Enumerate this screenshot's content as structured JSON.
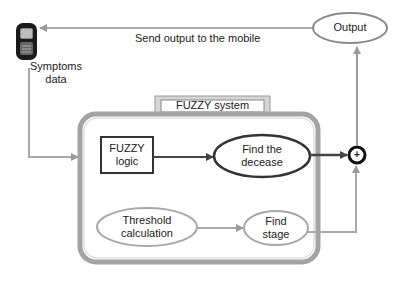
{
  "diagram": {
    "type": "flowchart",
    "nodes": {
      "mobile": {
        "label": "Symptoms data",
        "line1": "Symptoms",
        "line2": "data",
        "icon": "mobile-phone-icon"
      },
      "system_title": {
        "label": "FUZZY system"
      },
      "fuzzy_logic": {
        "line1": "FUZZY",
        "line2": "logic",
        "shape": "rectangle"
      },
      "find_decease": {
        "line1": "Find the",
        "line2": "decease",
        "shape": "ellipse"
      },
      "threshold": {
        "line1": "Threshold",
        "line2": "calculation",
        "shape": "ellipse"
      },
      "find_stage": {
        "line1": "Find",
        "line2": "stage",
        "shape": "ellipse"
      },
      "sum": {
        "symbol": "+",
        "shape": "circle"
      },
      "output": {
        "label": "Output",
        "shape": "ellipse"
      }
    },
    "edges": [
      {
        "from": "mobile",
        "to": "fuzzy_system",
        "label": ""
      },
      {
        "from": "fuzzy_logic",
        "to": "find_decease",
        "label": ""
      },
      {
        "from": "threshold",
        "to": "find_stage",
        "label": ""
      },
      {
        "from": "find_decease",
        "to": "sum",
        "label": ""
      },
      {
        "from": "find_stage",
        "to": "sum",
        "label": ""
      },
      {
        "from": "sum",
        "to": "output",
        "label": ""
      },
      {
        "from": "output",
        "to": "mobile",
        "label": "Send output to the mobile"
      }
    ],
    "feedback_label": "Send output to the mobile"
  },
  "colors": {
    "dark": "#333333",
    "gray": "#9a9a9a",
    "light_gray": "#b5b5b5",
    "background": "#ffffff"
  }
}
